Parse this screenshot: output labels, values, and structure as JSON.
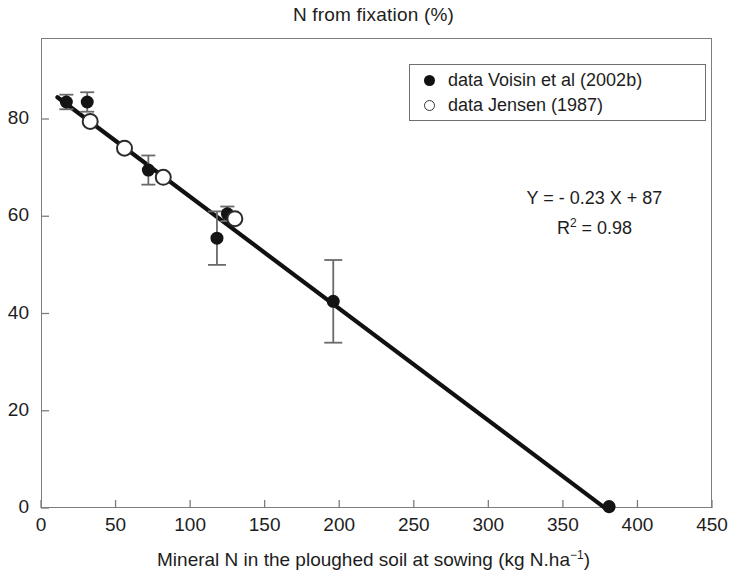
{
  "title": "N from fixation (%)",
  "axis": {
    "x_label_main": "Mineral N in the ploughed soil at sowing (kg N.ha",
    "x_label_sup": "−1",
    "x_label_tail": ")",
    "x_ticks": [
      "0",
      "50",
      "100",
      "150",
      "200",
      "250",
      "300",
      "350",
      "400",
      "450"
    ],
    "y_ticks": [
      "0",
      "20",
      "40",
      "60",
      "80"
    ]
  },
  "legend": {
    "items": [
      {
        "marker": "filled-circle",
        "label": "data Voisin et al (2002b)"
      },
      {
        "marker": "open-circle",
        "label": "data Jensen (1987)"
      }
    ]
  },
  "annotation": {
    "equation": "Y = - 0.23 X + 87",
    "r2_prefix": "R",
    "r2_sup": "2",
    "r2_value": " = 0.98"
  },
  "chart_data": {
    "type": "scatter",
    "title": "N from fixation (%)",
    "xlabel": "Mineral N in the ploughed soil at sowing (kg N.ha−1)",
    "ylabel": "N from fixation (%)",
    "xlim": [
      0,
      450
    ],
    "ylim": [
      0,
      90
    ],
    "xticks": [
      0,
      50,
      100,
      150,
      200,
      250,
      300,
      350,
      400,
      450
    ],
    "yticks": [
      0,
      20,
      40,
      60,
      80
    ],
    "grid": false,
    "legend_position": "top-right",
    "series": [
      {
        "name": "data Voisin et al (2002b)",
        "marker": "filled-circle",
        "points": [
          {
            "x": 17,
            "y": 83.5,
            "yerr": 1.5
          },
          {
            "x": 31,
            "y": 83.5,
            "yerr": 2.0
          },
          {
            "x": 72,
            "y": 69.5,
            "yerr": 3.0
          },
          {
            "x": 125,
            "y": 60.5,
            "yerr": 1.5
          },
          {
            "x": 118,
            "y": 55.5,
            "yerr": 5.5
          },
          {
            "x": 196,
            "y": 42.5,
            "yerr": 8.5
          },
          {
            "x": 381,
            "y": 0.3,
            "yerr": 0
          }
        ]
      },
      {
        "name": "data Jensen (1987)",
        "marker": "open-circle",
        "points": [
          {
            "x": 33,
            "y": 79.5
          },
          {
            "x": 56,
            "y": 74.0
          },
          {
            "x": 82,
            "y": 68.0
          },
          {
            "x": 130,
            "y": 59.5
          }
        ]
      }
    ],
    "fit_line": {
      "equation": "Y = - 0.23 X + 87",
      "slope": -0.23,
      "intercept": 87,
      "r_squared": 0.98,
      "x_range": [
        11,
        381
      ]
    }
  }
}
